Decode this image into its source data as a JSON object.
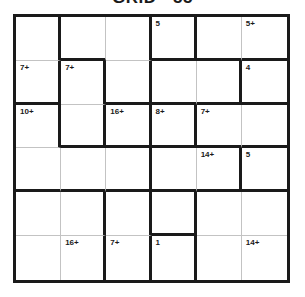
{
  "title": "GRID - 55",
  "colors": {
    "thick_line": "#1a1a1a",
    "thin_line": "#c3c3c3",
    "background": "#ffffff",
    "label_text": "#1a1a1a"
  },
  "grid": {
    "rows": 6,
    "cols": 6,
    "cells": [
      {
        "r": 1,
        "c": 1,
        "label": "",
        "right": "thick",
        "bottom": "thin"
      },
      {
        "r": 1,
        "c": 2,
        "label": "",
        "right": "thin",
        "bottom": "thick"
      },
      {
        "r": 1,
        "c": 3,
        "label": "",
        "right": "thick",
        "bottom": "thin"
      },
      {
        "r": 1,
        "c": 4,
        "label": "5",
        "right": "thick",
        "bottom": "thick"
      },
      {
        "r": 1,
        "c": 5,
        "label": "",
        "right": "thin",
        "bottom": "thick"
      },
      {
        "r": 1,
        "c": 6,
        "label": "5+",
        "right": "none",
        "bottom": "thick"
      },
      {
        "r": 2,
        "c": 1,
        "label": "7+",
        "right": "thick",
        "bottom": "thick"
      },
      {
        "r": 2,
        "c": 2,
        "label": "7+",
        "right": "thick",
        "bottom": "thin"
      },
      {
        "r": 2,
        "c": 3,
        "label": "",
        "right": "thick",
        "bottom": "thick"
      },
      {
        "r": 2,
        "c": 4,
        "label": "",
        "right": "thin",
        "bottom": "thick"
      },
      {
        "r": 2,
        "c": 5,
        "label": "",
        "right": "thick",
        "bottom": "thick"
      },
      {
        "r": 2,
        "c": 6,
        "label": "4",
        "right": "none",
        "bottom": "thick"
      },
      {
        "r": 3,
        "c": 1,
        "label": "10+",
        "right": "thick",
        "bottom": "thin"
      },
      {
        "r": 3,
        "c": 2,
        "label": "",
        "right": "thick",
        "bottom": "thick"
      },
      {
        "r": 3,
        "c": 3,
        "label": "16+",
        "right": "thick",
        "bottom": "thick"
      },
      {
        "r": 3,
        "c": 4,
        "label": "8+",
        "right": "thick",
        "bottom": "thick"
      },
      {
        "r": 3,
        "c": 5,
        "label": "7+",
        "right": "thin",
        "bottom": "thick"
      },
      {
        "r": 3,
        "c": 6,
        "label": "",
        "right": "none",
        "bottom": "thick"
      },
      {
        "r": 4,
        "c": 1,
        "label": "",
        "right": "thin",
        "bottom": "thick"
      },
      {
        "r": 4,
        "c": 2,
        "label": "",
        "right": "thin",
        "bottom": "thick"
      },
      {
        "r": 4,
        "c": 3,
        "label": "",
        "right": "thick",
        "bottom": "thick"
      },
      {
        "r": 4,
        "c": 4,
        "label": "",
        "right": "thin",
        "bottom": "thick"
      },
      {
        "r": 4,
        "c": 5,
        "label": "14+",
        "right": "thick",
        "bottom": "thick"
      },
      {
        "r": 4,
        "c": 6,
        "label": "5",
        "right": "none",
        "bottom": "thick"
      },
      {
        "r": 5,
        "c": 1,
        "label": "",
        "right": "thin",
        "bottom": "thin"
      },
      {
        "r": 5,
        "c": 2,
        "label": "",
        "right": "thick",
        "bottom": "thin"
      },
      {
        "r": 5,
        "c": 3,
        "label": "",
        "right": "thick",
        "bottom": "thin"
      },
      {
        "r": 5,
        "c": 4,
        "label": "",
        "right": "thick",
        "bottom": "thick"
      },
      {
        "r": 5,
        "c": 5,
        "label": "",
        "right": "thin",
        "bottom": "thin"
      },
      {
        "r": 5,
        "c": 6,
        "label": "",
        "right": "none",
        "bottom": "thin"
      },
      {
        "r": 6,
        "c": 1,
        "label": "",
        "right": "thin",
        "bottom": "none"
      },
      {
        "r": 6,
        "c": 2,
        "label": "16+",
        "right": "thick",
        "bottom": "none"
      },
      {
        "r": 6,
        "c": 3,
        "label": "7+",
        "right": "thick",
        "bottom": "none"
      },
      {
        "r": 6,
        "c": 4,
        "label": "1",
        "right": "thick",
        "bottom": "none"
      },
      {
        "r": 6,
        "c": 5,
        "label": "",
        "right": "thin",
        "bottom": "none"
      },
      {
        "r": 6,
        "c": 6,
        "label": "14+",
        "right": "none",
        "bottom": "none"
      }
    ]
  }
}
